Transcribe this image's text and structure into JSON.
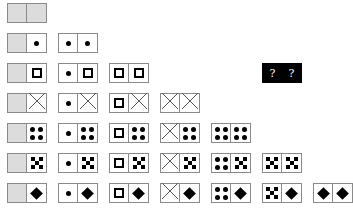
{
  "puzzle": {
    "description": "Domino tile set: each tile pairs two faces; series ordered by row; one hidden tile",
    "face_types": [
      "blank",
      "dot",
      "square",
      "cross",
      "four-dots",
      "five-checker",
      "diamond"
    ],
    "unknown_tile": {
      "left": "?",
      "right": "?",
      "row": 3,
      "col": 6,
      "background": "#000000"
    },
    "colors": {
      "blank_fill": "#dcdcdc",
      "border": "#8a8a8a",
      "ink": "#000000"
    }
  },
  "rows": [
    {
      "row": 1,
      "tiles": [
        {
          "left": "blank",
          "right": "blank"
        }
      ]
    },
    {
      "row": 2,
      "tiles": [
        {
          "left": "blank",
          "right": "dot"
        },
        {
          "left": "dot",
          "right": "dot"
        }
      ]
    },
    {
      "row": 3,
      "tiles": [
        {
          "left": "blank",
          "right": "square"
        },
        {
          "left": "dot",
          "right": "square"
        },
        {
          "left": "square",
          "right": "square"
        }
      ]
    },
    {
      "row": 4,
      "tiles": [
        {
          "left": "blank",
          "right": "cross"
        },
        {
          "left": "dot",
          "right": "cross"
        },
        {
          "left": "square",
          "right": "cross"
        },
        {
          "left": "cross",
          "right": "cross"
        }
      ]
    },
    {
      "row": 5,
      "tiles": [
        {
          "left": "blank",
          "right": "four-dots"
        },
        {
          "left": "dot",
          "right": "four-dots"
        },
        {
          "left": "square",
          "right": "four-dots"
        },
        {
          "left": "cross",
          "right": "four-dots"
        },
        {
          "left": "four-dots",
          "right": "four-dots"
        }
      ]
    },
    {
      "row": 6,
      "tiles": [
        {
          "left": "blank",
          "right": "five-checker"
        },
        {
          "left": "dot",
          "right": "five-checker"
        },
        {
          "left": "square",
          "right": "five-checker"
        },
        {
          "left": "cross",
          "right": "five-checker"
        },
        {
          "left": "four-dots",
          "right": "five-checker"
        },
        {
          "left": "five-checker",
          "right": "five-checker"
        }
      ]
    },
    {
      "row": 7,
      "tiles": [
        {
          "left": "blank",
          "right": "diamond"
        },
        {
          "left": "dot",
          "right": "diamond"
        },
        {
          "left": "square",
          "right": "diamond"
        },
        {
          "left": "cross",
          "right": "diamond"
        },
        {
          "left": "four-dots",
          "right": "diamond"
        },
        {
          "left": "five-checker",
          "right": "diamond"
        },
        {
          "left": "diamond",
          "right": "diamond"
        }
      ]
    }
  ],
  "labels": {
    "unknown_left": "?",
    "unknown_right": "?"
  }
}
